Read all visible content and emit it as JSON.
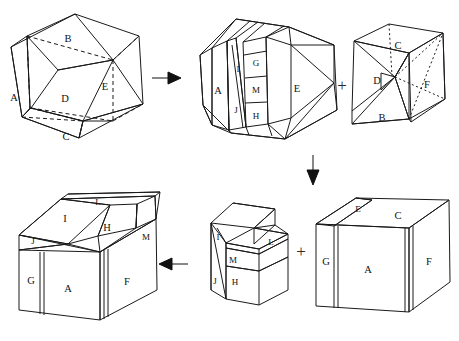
{
  "figure": {
    "background_color": "#ffffff",
    "line_color": "#1a1a1a",
    "label_color": "#111111"
  },
  "panels": [
    {
      "id": "panel-1",
      "name": "original-polyhedron",
      "position": "top-left",
      "labels": [
        {
          "text": "A",
          "x": 14,
          "y": 99
        },
        {
          "text": "B",
          "x": 68,
          "y": 40
        },
        {
          "text": "C",
          "x": 66,
          "y": 138
        },
        {
          "text": "D",
          "x": 65,
          "y": 100
        },
        {
          "text": "E",
          "x": 105,
          "y": 88
        }
      ]
    },
    {
      "id": "panel-2",
      "name": "sliced-polyhedron",
      "position": "top-middle",
      "labels": [
        {
          "text": "A",
          "x": 218,
          "y": 92
        },
        {
          "text": "I",
          "x": 238,
          "y": 70
        },
        {
          "text": "J",
          "x": 237,
          "y": 111
        },
        {
          "text": "G",
          "x": 255,
          "y": 63
        },
        {
          "text": "M",
          "x": 255,
          "y": 91
        },
        {
          "text": "H",
          "x": 255,
          "y": 117
        },
        {
          "text": "E",
          "x": 297,
          "y": 90
        }
      ]
    },
    {
      "id": "panel-3",
      "name": "wedge-piece",
      "position": "top-right",
      "labels": [
        {
          "text": "C",
          "x": 398,
          "y": 47
        },
        {
          "text": "D",
          "x": 379,
          "y": 82
        },
        {
          "text": "B",
          "x": 382,
          "y": 119
        },
        {
          "text": "F",
          "x": 427,
          "y": 86
        }
      ]
    },
    {
      "id": "panel-4",
      "name": "assembled-cube-final",
      "position": "bottom-left",
      "labels": [
        {
          "text": "L",
          "x": 98,
          "y": 203
        },
        {
          "text": "I",
          "x": 65,
          "y": 220
        },
        {
          "text": "H",
          "x": 107,
          "y": 229
        },
        {
          "text": "M",
          "x": 146,
          "y": 238
        },
        {
          "text": "J",
          "x": 35,
          "y": 242
        },
        {
          "text": "G",
          "x": 31,
          "y": 282
        },
        {
          "text": "A",
          "x": 68,
          "y": 290
        },
        {
          "text": "F",
          "x": 127,
          "y": 283
        }
      ]
    },
    {
      "id": "panel-5",
      "name": "stepped-piece",
      "position": "bottom-middle",
      "labels": [
        {
          "text": "I",
          "x": 219,
          "y": 238
        },
        {
          "text": "L",
          "x": 271,
          "y": 243
        },
        {
          "text": "M",
          "x": 233,
          "y": 261
        },
        {
          "text": "J",
          "x": 216,
          "y": 282
        },
        {
          "text": "H",
          "x": 235,
          "y": 283
        }
      ]
    },
    {
      "id": "panel-6",
      "name": "partial-cube",
      "position": "bottom-right",
      "labels": [
        {
          "text": "E",
          "x": 360,
          "y": 210
        },
        {
          "text": "C",
          "x": 398,
          "y": 217
        },
        {
          "text": "G",
          "x": 327,
          "y": 263
        },
        {
          "text": "A",
          "x": 368,
          "y": 271
        },
        {
          "text": "F",
          "x": 429,
          "y": 263
        }
      ]
    }
  ],
  "operators": [
    {
      "name": "arrow-right-top",
      "glyph": "arrow",
      "direction": "right",
      "x": 160,
      "y": 78
    },
    {
      "name": "plus-top",
      "glyph": "+",
      "x": 342,
      "y": 87
    },
    {
      "name": "arrow-down",
      "glyph": "arrow",
      "direction": "down",
      "x": 313,
      "y": 155
    },
    {
      "name": "plus-bottom",
      "glyph": "+",
      "x": 301,
      "y": 253
    },
    {
      "name": "arrow-left-bottom",
      "glyph": "arrow",
      "direction": "left",
      "x": 172,
      "y": 264
    }
  ]
}
